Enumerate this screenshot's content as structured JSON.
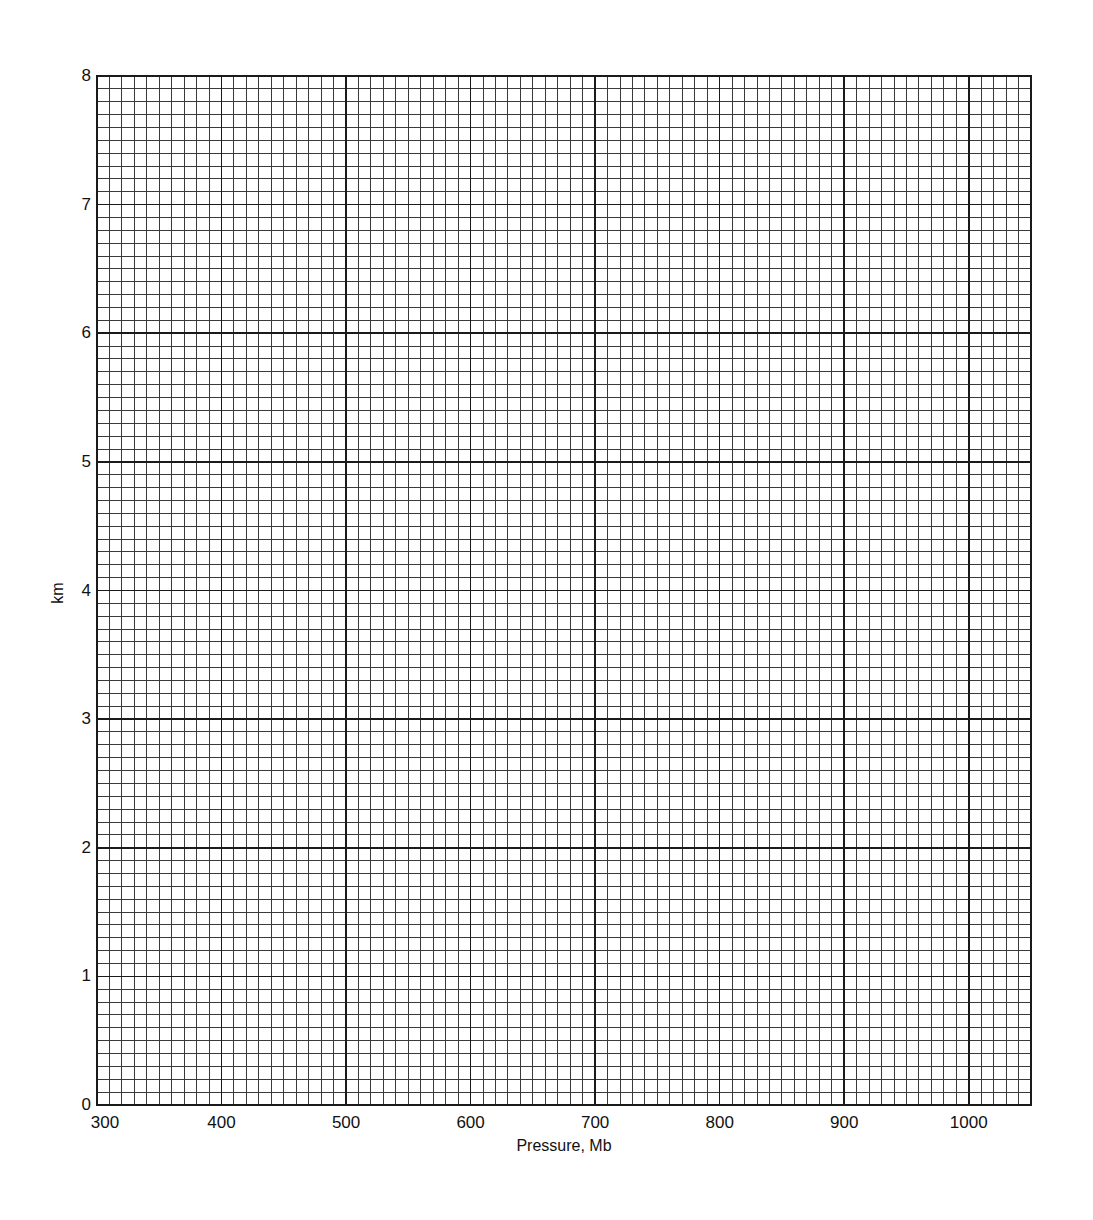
{
  "chart_data": {
    "type": "line",
    "title": "",
    "xlabel": "Pressure, Mb",
    "ylabel": "km",
    "xlim": [
      300,
      1050
    ],
    "ylim": [
      0,
      8
    ],
    "x_ticks": [
      300,
      400,
      500,
      600,
      700,
      800,
      900,
      1000
    ],
    "y_ticks": [
      0,
      1,
      2,
      3,
      4,
      5,
      6,
      7,
      8
    ],
    "x_minor_step": 10,
    "y_minor_step": 0.1,
    "grid": true,
    "series": [],
    "legend": null
  },
  "axes": {
    "x_label": "Pressure, Mb",
    "y_label": "km",
    "x_tick_labels": [
      "300",
      "400",
      "500",
      "600",
      "700",
      "800",
      "900",
      "1000"
    ],
    "y_tick_labels": [
      "0",
      "1",
      "2",
      "3",
      "4",
      "5",
      "6",
      "7",
      "8"
    ]
  },
  "colors": {
    "grid_major": "#1a1a1a",
    "grid_minor": "#3a3a3a",
    "background": "#ffffff"
  }
}
